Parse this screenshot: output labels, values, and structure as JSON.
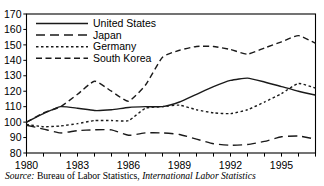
{
  "chart_data": {
    "type": "line",
    "title": "",
    "subtitle": "",
    "xlabel": "",
    "ylabel": "",
    "xlim": [
      1980,
      1997
    ],
    "ylim": [
      80,
      170
    ],
    "grid": false,
    "legend_position": "top-left-inside",
    "y_ticks": [
      80,
      90,
      100,
      110,
      120,
      130,
      140,
      150,
      160,
      170
    ],
    "y_tick_labels": [
      "80",
      "90",
      "100",
      "110",
      "120",
      "130",
      "140",
      "150",
      "160",
      "170"
    ],
    "x_ticks": [
      1980,
      1981,
      1982,
      1983,
      1984,
      1985,
      1986,
      1987,
      1988,
      1989,
      1990,
      1991,
      1992,
      1993,
      1994,
      1995,
      1996,
      1997
    ],
    "x_tick_labels": [
      "1980",
      "",
      "",
      "1983",
      "",
      "",
      "1986",
      "",
      "",
      "1989",
      "",
      "",
      "1992",
      "",
      "",
      "1995",
      "",
      ""
    ],
    "x": [
      1980,
      1981,
      1982,
      1983,
      1984,
      1985,
      1986,
      1987,
      1988,
      1989,
      1990,
      1991,
      1992,
      1993,
      1994,
      1995,
      1996,
      1997
    ],
    "series": [
      {
        "name": "United States",
        "dash": "solid",
        "dasharray": "",
        "values": [
          100,
          105.5,
          110,
          109,
          107.5,
          108,
          109.5,
          110,
          110,
          113,
          118,
          123,
          127,
          128.5,
          126,
          123,
          120,
          117.5
        ]
      },
      {
        "name": "Japan",
        "dash": "long-dash",
        "dasharray": "9,5",
        "values": [
          98,
          95.5,
          93,
          94.5,
          95,
          95,
          91.5,
          93,
          93,
          92,
          89,
          86,
          85,
          85.5,
          87.5,
          90.5,
          91,
          89
        ]
      },
      {
        "name": "Germany",
        "dash": "dotted",
        "dasharray": "2.5,2.5",
        "values": [
          98.5,
          97,
          97.5,
          99,
          101,
          101,
          101,
          109,
          110,
          111,
          108,
          106,
          105.5,
          108,
          113,
          118.5,
          125,
          122
        ]
      },
      {
        "name": "South Korea",
        "dash": "dash",
        "dasharray": "6,3.5",
        "values": [
          100,
          106,
          110,
          118,
          126.5,
          120,
          113.5,
          124,
          142,
          146.5,
          149,
          149,
          147,
          144,
          148,
          152,
          156,
          151
        ]
      }
    ]
  },
  "legend": {
    "items": [
      {
        "label": "United States"
      },
      {
        "label": "Japan"
      },
      {
        "label": "Germany"
      },
      {
        "label": "South Korea"
      }
    ]
  },
  "source": {
    "prefix": "Source:",
    "agency": " Bureau of Labor Statistics,",
    "publication": " International Labor Statistics"
  }
}
